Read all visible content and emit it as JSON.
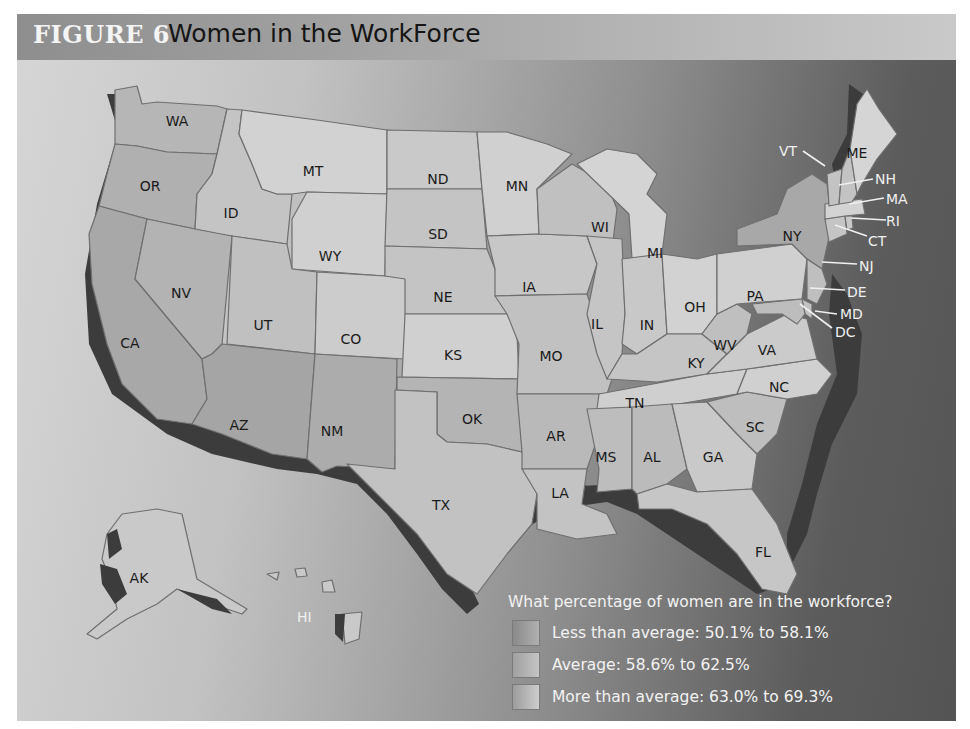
{
  "figure": {
    "number": "FIGURE 6",
    "title": "Women in the WorkForce"
  },
  "legend": {
    "question": "What percentage of women are in the workforce?",
    "items": [
      {
        "label": "Less than average: 50.1% to 58.1%",
        "category": "less",
        "color": "#9c9c9c"
      },
      {
        "label": "Average: 58.6% to 62.5%",
        "category": "average",
        "color": "#b4b4b4"
      },
      {
        "label": "More than average: 63.0% to 69.3%",
        "category": "more",
        "color": "#cfcfcf"
      }
    ]
  },
  "colors": {
    "less": "#a2a2a2",
    "average": "#b6b6b6",
    "more": "#d0d0d0",
    "coast": "#3c3c3c"
  },
  "states": {
    "WA": "WA",
    "OR": "OR",
    "CA": "CA",
    "ID": "ID",
    "NV": "NV",
    "MT": "MT",
    "WY": "WY",
    "UT": "UT",
    "AZ": "AZ",
    "CO": "CO",
    "NM": "NM",
    "ND": "ND",
    "SD": "SD",
    "NE": "NE",
    "KS": "KS",
    "OK": "OK",
    "TX": "TX",
    "MN": "MN",
    "IA": "IA",
    "MO": "MO",
    "AR": "AR",
    "LA": "LA",
    "WI": "WI",
    "IL": "IL",
    "MI": "MI",
    "IN": "IN",
    "OH": "OH",
    "KY": "KY",
    "TN": "TN",
    "MS": "MS",
    "AL": "AL",
    "GA": "GA",
    "FL": "FL",
    "SC": "SC",
    "NC": "NC",
    "VA": "VA",
    "WV": "WV",
    "PA": "PA",
    "NY": "NY",
    "ME": "ME",
    "VT": "VT",
    "NH": "NH",
    "MA": "MA",
    "RI": "RI",
    "CT": "CT",
    "NJ": "NJ",
    "DE": "DE",
    "MD": "MD",
    "DC": "DC",
    "AK": "AK",
    "HI": "HI"
  }
}
